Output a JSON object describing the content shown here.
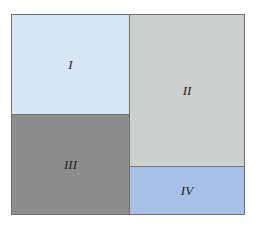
{
  "diagram": {
    "regions": [
      {
        "id": "I",
        "label": "I",
        "color": "#d6e6f4"
      },
      {
        "id": "II",
        "label": "II",
        "color": "#cdd0ce"
      },
      {
        "id": "III",
        "label": "III",
        "color": "#8d8d8d"
      },
      {
        "id": "IV",
        "label": "IV",
        "color": "#a7c1e6"
      }
    ]
  }
}
